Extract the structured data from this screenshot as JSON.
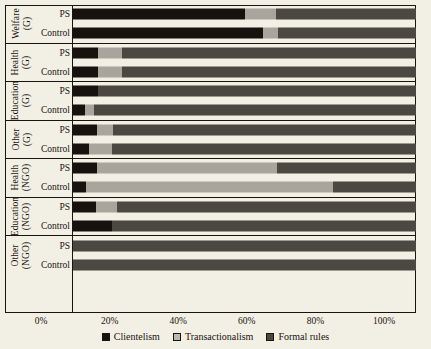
{
  "chart_data": {
    "type": "bar",
    "orientation": "horizontal",
    "stacked": true,
    "stacked_normalized": true,
    "title": "",
    "xlabel": "",
    "ylabel": "",
    "xlim": [
      0,
      100
    ],
    "xticks": [
      "0%",
      "20%",
      "40%",
      "60%",
      "80%",
      "100%"
    ],
    "xtick_values": [
      0,
      20,
      40,
      60,
      80,
      100
    ],
    "grid": false,
    "legend_position": "bottom-center",
    "series": [
      {
        "name": "Clientelism",
        "color": "#17120e"
      },
      {
        "name": "Transactionalism",
        "color": "#a9a59d"
      },
      {
        "name": "Formal rules",
        "color": "#4b4741"
      }
    ],
    "groups": [
      {
        "label_line1": "Welfare",
        "label_line2": "(G)",
        "rows": [
          {
            "name": "PS",
            "values": [
              50.0,
              9.3,
              40.7
            ]
          },
          {
            "name": "Control",
            "values": [
              55.4,
              4.4,
              40.2
            ]
          }
        ]
      },
      {
        "label_line1": "Health",
        "label_line2": "(G)",
        "rows": [
          {
            "name": "PS",
            "values": [
              7.3,
              7.0,
              85.7
            ]
          },
          {
            "name": "Control",
            "values": [
              7.3,
              7.0,
              85.7
            ]
          }
        ]
      },
      {
        "label_line1": "Education",
        "label_line2": "(G)",
        "rows": [
          {
            "name": "PS",
            "values": [
              7.3,
              0.0,
              92.7
            ]
          },
          {
            "name": "Control",
            "values": [
              3.5,
              2.6,
              93.9
            ]
          }
        ]
      },
      {
        "label_line1": "Other",
        "label_line2": "(G)",
        "rows": [
          {
            "name": "PS",
            "values": [
              7.0,
              4.7,
              88.3
            ]
          },
          {
            "name": "Control",
            "values": [
              4.7,
              6.7,
              88.6
            ]
          }
        ]
      },
      {
        "label_line1": "Health",
        "label_line2": "(NGO)",
        "rows": [
          {
            "name": "PS",
            "values": [
              7.0,
              52.5,
              40.5
            ]
          },
          {
            "name": "Control",
            "values": [
              3.8,
              72.0,
              24.2
            ]
          }
        ]
      },
      {
        "label_line1": "Education",
        "label_line2": "(NGO)",
        "rows": [
          {
            "name": "PS",
            "values": [
              6.7,
              6.1,
              87.2
            ]
          },
          {
            "name": "Control",
            "values": [
              11.4,
              0.0,
              88.6
            ]
          }
        ]
      },
      {
        "label_line1": "Other",
        "label_line2": "(NGO)",
        "rows": [
          {
            "name": "PS",
            "values": [
              0.0,
              0.0,
              100.0
            ]
          },
          {
            "name": "Control",
            "values": [
              0.0,
              0.0,
              100.0
            ]
          }
        ]
      }
    ]
  }
}
